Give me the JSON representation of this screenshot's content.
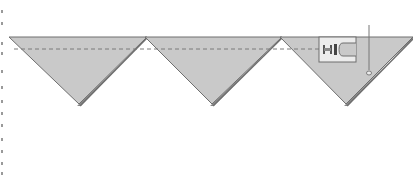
{
  "diagram": {
    "title": "",
    "colors": {
      "fabric": "#c9c9c9",
      "fabric_edge": "#6e6e6e",
      "fold_shadow": "#8a8a8a",
      "seam_line": "#7a7a7a",
      "presser_foot_fill": "#ececec",
      "presser_foot_stroke": "#6e6e6e",
      "needle": "#777777",
      "background": "#ffffff"
    },
    "geometry": {
      "top_edge_y": 37,
      "seam_y": 49,
      "tip_y": 106,
      "triangles": [
        {
          "name": "triangle-1",
          "left_x": 9,
          "right_x": 147,
          "tip_x": 79
        },
        {
          "name": "triangle-2",
          "left_x": 145,
          "right_x": 282,
          "tip_x": 212
        },
        {
          "name": "triangle-3",
          "left_x": 280,
          "right_x": 413,
          "tip_x": 346
        }
      ],
      "seam": {
        "x1": 14,
        "x2": 322
      },
      "presser_foot": {
        "x": 319,
        "y": 37,
        "w": 37,
        "h": 25
      },
      "needle": {
        "x": 369,
        "y1": 25,
        "y2": 70,
        "eye_y": 73
      }
    },
    "left_edge_marks": [
      10,
      22,
      42,
      52,
      70,
      86,
      100,
      112,
      124,
      138,
      150,
      162,
      172
    ]
  }
}
